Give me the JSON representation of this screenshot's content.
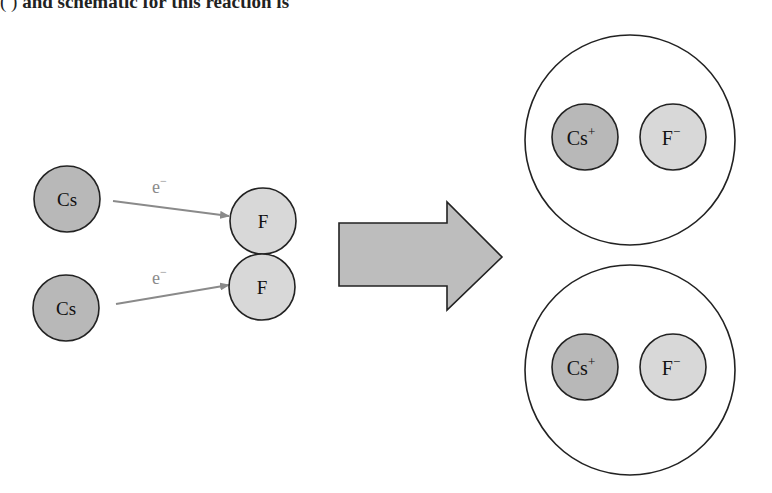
{
  "caption_fragment": {
    "lead": "(                    )",
    "text": "and schematic for this reaction is"
  },
  "colors": {
    "cs_fill": "#b8b8b8",
    "f_fill": "#d8d8d8",
    "stroke": "#222222",
    "electron_arrow": "#8a8a8a",
    "big_arrow_fill": "#bdbdbd",
    "ion_pair_fill": "#ffffff"
  },
  "reactants": {
    "cesium_atoms": [
      {
        "label": "Cs"
      },
      {
        "label": "Cs"
      }
    ],
    "fluorine_atoms": [
      {
        "label": "F"
      },
      {
        "label": "F"
      }
    ],
    "electron_transfers": [
      {
        "label": "e",
        "charge": "−"
      },
      {
        "label": "e",
        "charge": "−"
      }
    ]
  },
  "products": {
    "ion_pairs": [
      {
        "cation": {
          "symbol": "Cs",
          "charge": "+"
        },
        "anion": {
          "symbol": "F",
          "charge": "−"
        }
      },
      {
        "cation": {
          "symbol": "Cs",
          "charge": "+"
        },
        "anion": {
          "symbol": "F",
          "charge": "−"
        }
      }
    ]
  }
}
